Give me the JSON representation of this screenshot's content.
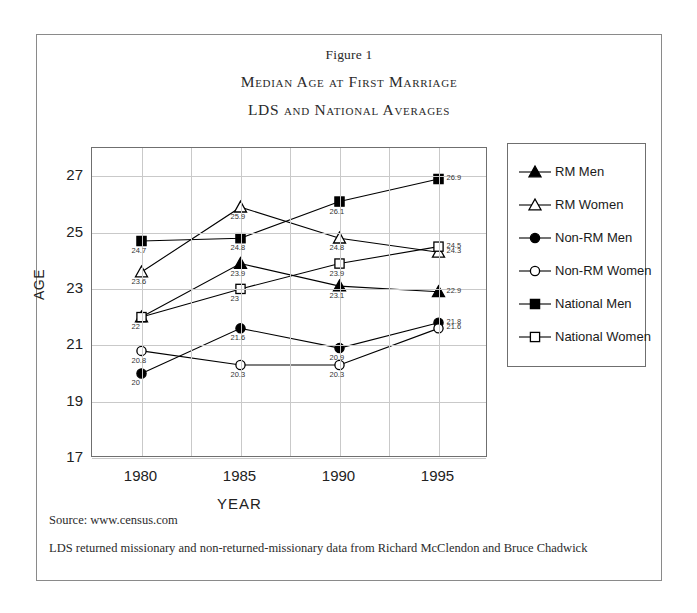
{
  "figure": {
    "number_label": "Figure 1",
    "title_line1": "Median Age at First Marriage",
    "title_line2": "LDS and National Averages"
  },
  "notes": {
    "source": "Source: www.census.com",
    "data_note": "LDS returned missionary and non-returned-missionary data from Richard McClendon and Bruce Chadwick"
  },
  "chart_data": {
    "type": "line",
    "xlabel": "YEAR",
    "ylabel": "AGE",
    "x": [
      "1980",
      "1985",
      "1990",
      "1995"
    ],
    "categories": [
      "1980",
      "1985",
      "1990",
      "1995"
    ],
    "ylim": [
      17,
      28
    ],
    "yticks": [
      27,
      25,
      23,
      21,
      19,
      17
    ],
    "grid": true,
    "legend_position": "right",
    "series": [
      {
        "name": "RM Men",
        "marker": "filled-triangle",
        "color": "#000000",
        "values": [
          22,
          23.9,
          23.1,
          22.9
        ],
        "labels": [
          "22",
          "23.9",
          "23.1",
          "22.9"
        ]
      },
      {
        "name": "RM Women",
        "marker": "open-triangle",
        "color": "#000000",
        "values": [
          23.6,
          25.9,
          24.8,
          24.3
        ],
        "labels": [
          "23.6",
          "25.9",
          "24.8",
          "24.3"
        ]
      },
      {
        "name": "Non-RM Men",
        "marker": "filled-circle",
        "color": "#000000",
        "values": [
          20,
          21.6,
          20.9,
          21.8
        ],
        "labels": [
          "20",
          "21.6",
          "20.9",
          "21.8"
        ]
      },
      {
        "name": "Non-RM Women",
        "marker": "open-circle",
        "color": "#000000",
        "values": [
          20.8,
          20.3,
          20.3,
          21.6
        ],
        "labels": [
          "20.8",
          "20.3",
          "20.3",
          "21.6"
        ]
      },
      {
        "name": "National Men",
        "marker": "filled-square",
        "color": "#000000",
        "values": [
          24.7,
          24.8,
          26.1,
          26.9
        ],
        "labels": [
          "24.7",
          "24.8",
          "26.1",
          "26.9"
        ]
      },
      {
        "name": "National Women",
        "marker": "open-square",
        "color": "#000000",
        "values": [
          22,
          23,
          23.9,
          24.5
        ],
        "labels": [
          "",
          "23",
          "23.9",
          "24.5"
        ]
      }
    ]
  }
}
